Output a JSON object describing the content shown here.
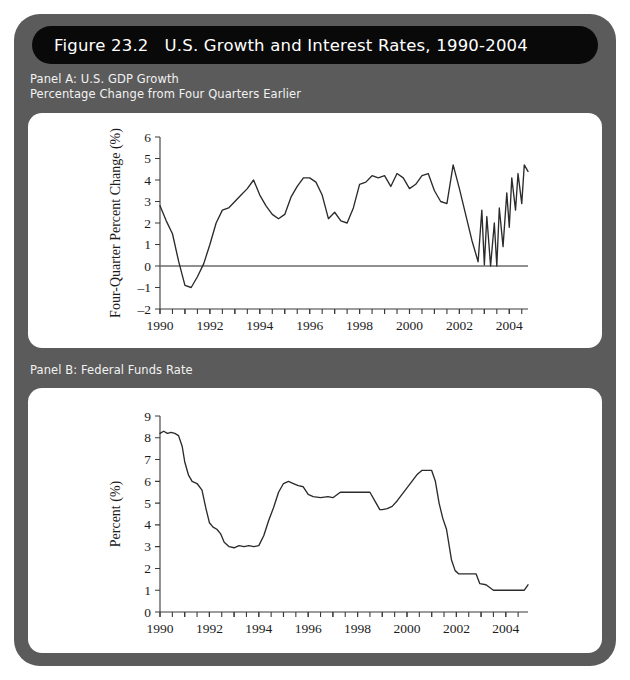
{
  "figure": {
    "number_label": "Figure 23.2",
    "title": "U.S. Growth and Interest Rates, 1990-2004",
    "frame_color": "#5b5b5b",
    "title_bar_color": "#090909",
    "card_color": "#ffffff",
    "line_color": "#2b2b2b"
  },
  "panel_a": {
    "caption": "Panel A: U.S. GDP Growth\nPercentage Change from Four Quarters Earlier"
  },
  "panel_b": {
    "caption": "Panel B: Federal Funds Rate"
  },
  "chart_data": [
    {
      "type": "line",
      "id": "panel-a",
      "title": "Panel A: U.S. GDP Growth",
      "subtitle": "Percentage Change from Four Quarters Earlier",
      "xlabel": "",
      "ylabel": "Four-Quarter Percent Change (%)",
      "xlim": [
        1990.0,
        2004.75
      ],
      "ylim": [
        -2,
        6
      ],
      "yticks": [
        -2,
        -1,
        0,
        1,
        2,
        3,
        4,
        5,
        6
      ],
      "ytick_labels": [
        "-2",
        "-1",
        "0",
        "1",
        "2",
        "3",
        "4",
        "5",
        "6"
      ],
      "xticks": [
        1990,
        1991,
        1992,
        1993,
        1994,
        1995,
        1996,
        1997,
        1998,
        1999,
        2000,
        2001,
        2002,
        2003,
        2004
      ],
      "xtick_labels": [
        "1990",
        "",
        "1992",
        "",
        "1994",
        "",
        "1996",
        "",
        "1998",
        "",
        "2000",
        "",
        "2002",
        "",
        "2004"
      ],
      "grid": false,
      "legend": false,
      "zero_line": true,
      "series": [
        {
          "name": "Four-Quarter Percent Change in U.S. Real GDP",
          "x": [
            1990.0,
            1990.25,
            1990.5,
            1990.75,
            1991.0,
            1991.25,
            1991.5,
            1991.75,
            1992.0,
            1992.25,
            1992.5,
            1992.75,
            1993.0,
            1993.25,
            1993.5,
            1993.75,
            1994.0,
            1994.25,
            1994.5,
            1994.75,
            1995.0,
            1995.25,
            1995.5,
            1995.75,
            1996.0,
            1996.25,
            1996.5,
            1996.75,
            1997.0,
            1997.25,
            1997.5,
            1997.75,
            1998.0,
            1998.25,
            1998.5,
            1998.75,
            1999.0,
            1999.25,
            1999.5,
            1999.75,
            2000.0,
            2000.25,
            2000.5,
            2000.75,
            2001.0,
            2001.25,
            2001.5,
            2001.75,
            2002.0,
            2002.25,
            2002.5,
            2002.75,
            2003.0,
            2003.25,
            2003.5,
            2003.75,
            2004.0,
            2004.25,
            2004.5
          ],
          "values": [
            2.8,
            2.1,
            1.5,
            0.2,
            -0.9,
            -1.0,
            -0.5,
            0.1,
            1.0,
            2.0,
            2.6,
            2.7,
            3.0,
            3.3,
            3.6,
            4.0,
            3.3,
            2.8,
            2.4,
            2.2,
            2.4,
            3.2,
            3.7,
            4.1,
            4.1,
            3.9,
            3.3,
            2.2,
            2.5,
            2.1,
            2.0,
            2.7,
            3.8,
            3.9,
            4.2,
            4.1,
            4.2,
            3.7,
            4.3,
            4.1,
            3.6,
            3.8,
            4.2,
            4.3,
            3.5,
            3.0,
            2.9,
            4.7,
            3.6,
            2.4,
            1.2,
            0.2,
            0.05,
            0.0,
            0.0,
            0.9,
            1.8,
            2.6,
            2.9
          ],
          "x_extra": [
            2002.9,
            2003.1,
            2003.4,
            2003.6,
            2003.9,
            2004.1,
            2004.35,
            2004.6,
            2004.75
          ],
          "values_extra": [
            2.6,
            2.3,
            2.0,
            2.7,
            3.4,
            4.1,
            4.3,
            4.7,
            4.4
          ]
        }
      ]
    },
    {
      "type": "line",
      "id": "panel-b",
      "title": "Panel B: Federal Funds Rate",
      "subtitle": "",
      "xlabel": "",
      "ylabel": "Percent (%)",
      "xlim": [
        1990.0,
        2004.9
      ],
      "ylim": [
        0,
        9
      ],
      "yticks": [
        0,
        1,
        2,
        3,
        4,
        5,
        6,
        7,
        8,
        9
      ],
      "ytick_labels": [
        "0",
        "1",
        "2",
        "3",
        "4",
        "5",
        "6",
        "7",
        "8",
        "9"
      ],
      "xticks": [
        1990,
        1991,
        1992,
        1993,
        1994,
        1995,
        1996,
        1997,
        1998,
        1999,
        2000,
        2001,
        2002,
        2003,
        2004
      ],
      "xtick_labels": [
        "1990",
        "",
        "1992",
        "",
        "1994",
        "",
        "1996",
        "",
        "1998",
        "",
        "2000",
        "",
        "2002",
        "",
        "2004"
      ],
      "grid": false,
      "legend": false,
      "zero_line": false,
      "series": [
        {
          "name": "Federal Funds Rate",
          "x": [
            1990.0,
            1990.15,
            1990.3,
            1990.45,
            1990.6,
            1990.75,
            1990.9,
            1991.0,
            1991.15,
            1991.3,
            1991.5,
            1991.7,
            1991.85,
            1992.0,
            1992.15,
            1992.3,
            1992.45,
            1992.6,
            1992.8,
            1993.0,
            1993.2,
            1993.4,
            1993.6,
            1993.8,
            1994.0,
            1994.2,
            1994.4,
            1994.6,
            1994.8,
            1995.0,
            1995.2,
            1995.4,
            1995.6,
            1995.8,
            1996.0,
            1996.2,
            1996.5,
            1996.8,
            1997.0,
            1997.3,
            1997.6,
            1997.9,
            1998.2,
            1998.5,
            1998.75,
            1998.9,
            1999.0,
            1999.2,
            1999.4,
            1999.6,
            1999.8,
            2000.0,
            2000.2,
            2000.4,
            2000.6,
            2000.8,
            2001.0,
            2001.15,
            2001.3,
            2001.45,
            2001.6,
            2001.8,
            2001.95,
            2002.1,
            2002.4,
            2002.8,
            2002.95,
            2003.2,
            2003.5,
            2003.8,
            2004.1,
            2004.5,
            2004.75,
            2004.9
          ],
          "values": [
            8.2,
            8.3,
            8.2,
            8.25,
            8.2,
            8.1,
            7.6,
            6.9,
            6.3,
            6.0,
            5.9,
            5.6,
            4.8,
            4.1,
            3.9,
            3.8,
            3.6,
            3.2,
            3.0,
            2.95,
            3.05,
            3.0,
            3.05,
            3.0,
            3.05,
            3.5,
            4.2,
            4.8,
            5.5,
            5.9,
            6.0,
            5.9,
            5.8,
            5.75,
            5.4,
            5.3,
            5.25,
            5.3,
            5.25,
            5.5,
            5.5,
            5.5,
            5.5,
            5.5,
            5.0,
            4.7,
            4.7,
            4.75,
            4.85,
            5.1,
            5.4,
            5.7,
            6.0,
            6.3,
            6.5,
            6.5,
            6.5,
            6.0,
            5.0,
            4.3,
            3.8,
            2.4,
            1.9,
            1.75,
            1.75,
            1.75,
            1.3,
            1.25,
            1.0,
            1.0,
            1.0,
            1.0,
            1.0,
            1.25
          ]
        }
      ]
    }
  ]
}
